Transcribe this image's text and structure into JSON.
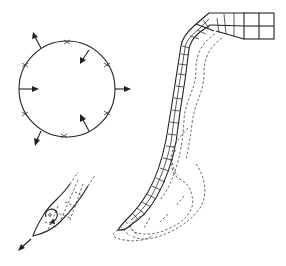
{
  "diagram": {
    "type": "technical-illustration",
    "canvas": {
      "width": 286,
      "height": 266,
      "background": "#ffffff",
      "ink": "#222222"
    },
    "panels": [
      {
        "id": "circle-panel",
        "description": "Circle with six cross markers and six force arrows (alternating outward/inward)",
        "circle": {
          "cx": 67,
          "cy": 89,
          "r": 48
        },
        "markers": [
          {
            "x": 67,
            "y": 42
          },
          {
            "x": 107,
            "y": 65
          },
          {
            "x": 107,
            "y": 113
          },
          {
            "x": 64,
            "y": 136
          },
          {
            "x": 25,
            "y": 114
          },
          {
            "x": 25,
            "y": 65
          }
        ],
        "arrows": [
          {
            "direction": "outward",
            "x1": 41,
            "y1": 48,
            "x2": 33,
            "y2": 33
          },
          {
            "direction": "inward",
            "x1": 89,
            "y1": 50,
            "x2": 81,
            "y2": 63
          },
          {
            "direction": "outward",
            "x1": 115,
            "y1": 89,
            "x2": 130,
            "y2": 89
          },
          {
            "direction": "inward",
            "x1": 19,
            "y1": 89,
            "x2": 38,
            "y2": 89
          },
          {
            "direction": "inward",
            "x1": 89,
            "y1": 131,
            "x2": 81,
            "y2": 116
          },
          {
            "direction": "outward",
            "x1": 41,
            "y1": 131,
            "x2": 35,
            "y2": 145
          }
        ]
      },
      {
        "id": "fingertip-panel",
        "description": "Tapered tip with dashed segment grid, circular rotation arrow and outward motion arrow"
      },
      {
        "id": "segmented-body-panel",
        "description": "Long segmented bending body with solid mesh and dashed deformed outlines"
      }
    ],
    "labels": []
  }
}
